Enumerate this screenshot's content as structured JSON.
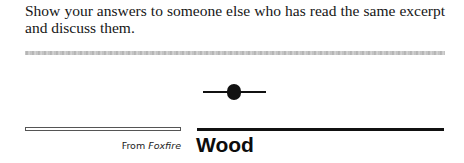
{
  "instruction": {
    "text": "Show your answers to someone else who has read the same excerpt and discuss them."
  },
  "ornament": {
    "icon": "section-divider-ornament-icon"
  },
  "section": {
    "source_prefix": "From",
    "source_work": "Foxfire",
    "title": "Wood"
  },
  "colors": {
    "text": "#161616",
    "rule": "#111111",
    "gray_divider": "#b0b0b0"
  }
}
